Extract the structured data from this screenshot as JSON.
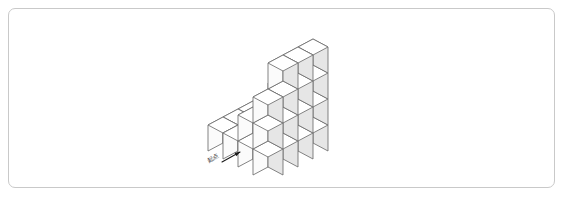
{
  "figure": {
    "frame": {
      "border_color": "#c9c9c9",
      "background": "#ffffff",
      "radius_px": 7
    },
    "colors": {
      "top_face": "#ffffff",
      "left_face": "#fbfbfb",
      "right_face": "#e6e6e6",
      "outline": "#6e6e6e",
      "arrow": "#1a1a1a",
      "label_text": "#3a3a3a"
    },
    "projection": {
      "type": "isometric",
      "cube_width_px": 30,
      "cube_half_width_px": 15,
      "cube_half_depth_px": 8,
      "cube_height_px": 26,
      "origin_x": 268,
      "origin_y": 119
    },
    "annotation": {
      "label": "起点",
      "label_rotation_deg": -30,
      "arrow_from": [
        222,
        162
      ],
      "arrow_to": [
        240,
        152
      ],
      "arrow_description": "short arrow pointing up-right toward the front-left base cube"
    },
    "grid": {
      "cols": 4,
      "rows": 4,
      "description": "Heights of stacked unit cubes at each (col,row) cell of the isometric base grid, viewed from front-left.",
      "heights": [
        [
          1,
          2,
          3,
          4
        ],
        [
          1,
          1,
          2,
          4
        ],
        [
          1,
          1,
          1,
          4
        ],
        [
          1,
          1,
          2,
          3
        ]
      ],
      "total_cubes": 32
    }
  }
}
